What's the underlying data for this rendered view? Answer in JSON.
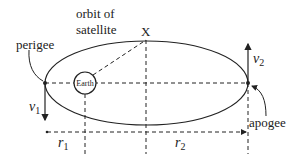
{
  "diagram": {
    "labels": {
      "orbit_line1": "orbit of",
      "orbit_line2": "satellite",
      "point_x": "X",
      "perigee": "perigee",
      "apogee": "apogee",
      "earth": "Earth",
      "v1": "v",
      "v1_sub": "1",
      "v2": "v",
      "v2_sub": "2",
      "r1": "r",
      "r1_sub": "1",
      "r2": "r",
      "r2_sub": "2"
    },
    "colors": {
      "stroke": "#222222",
      "background": "#ffffff"
    }
  }
}
